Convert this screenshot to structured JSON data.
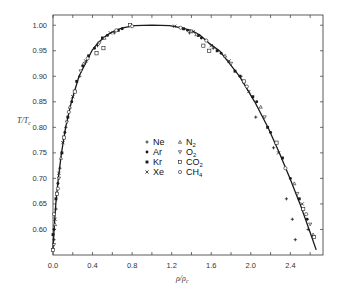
{
  "chart_data": {
    "type": "scatter",
    "title": "",
    "xlabel": "ρ/ρc",
    "ylabel": "T/Tc",
    "xlim": [
      0.0,
      2.73
    ],
    "ylim": [
      0.55,
      1.02
    ],
    "x_ticks": [
      0.0,
      0.2,
      0.4,
      0.6,
      0.8,
      1.0,
      1.2,
      1.4,
      1.6,
      1.8,
      2.0,
      2.2,
      2.4,
      2.6
    ],
    "x_tick_labels": [
      "0.0",
      "0.4",
      "0.8",
      "1.2",
      "1.6",
      "2.0",
      "2.4"
    ],
    "x_labeled_values": [
      0.0,
      0.4,
      0.8,
      1.2,
      1.6,
      2.0,
      2.4
    ],
    "y_ticks": [
      1.0,
      0.95,
      0.9,
      0.85,
      0.8,
      0.75,
      0.7,
      0.65,
      0.6
    ],
    "y_tick_labels": [
      "1.00",
      "0.95",
      "0.90",
      "0.85",
      "0.80",
      "0.75",
      "0.70",
      "0.65",
      "0.60"
    ],
    "grid": false,
    "legend_position": "center",
    "legend": [
      {
        "name": "Ne",
        "marker": "plus"
      },
      {
        "name": "Ar",
        "marker": "filled-circle"
      },
      {
        "name": "Kr",
        "marker": "filled-square"
      },
      {
        "name": "Xe",
        "marker": "cross"
      },
      {
        "name": "N2",
        "marker": "triangle-up"
      },
      {
        "name": "O2",
        "marker": "triangle-down"
      },
      {
        "name": "CO2",
        "marker": "open-square"
      },
      {
        "name": "CH4",
        "marker": "open-circle"
      }
    ],
    "curve": {
      "name": "fitted coexistence curve",
      "points": [
        [
          -0.001,
          0.56
        ],
        [
          0.011,
          0.6
        ],
        [
          0.028,
          0.65
        ],
        [
          0.054,
          0.7
        ],
        [
          0.086,
          0.75
        ],
        [
          0.127,
          0.8
        ],
        [
          0.186,
          0.85
        ],
        [
          0.263,
          0.9
        ],
        [
          0.393,
          0.95
        ],
        [
          0.452,
          0.965
        ],
        [
          0.54,
          0.98
        ],
        [
          0.632,
          0.99
        ],
        [
          0.705,
          0.995
        ],
        [
          0.827,
          0.999
        ],
        [
          1.0,
          1.0
        ],
        [
          1.18,
          0.999
        ],
        [
          1.303,
          0.995
        ],
        [
          1.395,
          0.99
        ],
        [
          1.49,
          0.98
        ],
        [
          1.576,
          0.965
        ],
        [
          1.682,
          0.95
        ],
        [
          1.887,
          0.9
        ],
        [
          2.039,
          0.85
        ],
        [
          2.173,
          0.8
        ],
        [
          2.289,
          0.75
        ],
        [
          2.396,
          0.7
        ],
        [
          2.497,
          0.65
        ],
        [
          2.589,
          0.6
        ],
        [
          2.661,
          0.56
        ]
      ]
    },
    "series": [
      {
        "name": "Ne",
        "marker": "plus",
        "points": [
          [
            0.01,
            0.58
          ],
          [
            0.03,
            0.64
          ],
          [
            0.07,
            0.72
          ],
          [
            0.13,
            0.8
          ],
          [
            0.27,
            0.9
          ],
          [
            0.45,
            0.96
          ],
          [
            0.62,
            0.985
          ],
          [
            1.38,
            0.985
          ],
          [
            1.62,
            0.955
          ],
          [
            1.9,
            0.9
          ],
          [
            2.05,
            0.82
          ],
          [
            2.23,
            0.76
          ],
          [
            2.36,
            0.66
          ],
          [
            2.42,
            0.62
          ],
          [
            2.45,
            0.58
          ],
          [
            2.58,
            0.6
          ]
        ]
      },
      {
        "name": "Ar",
        "marker": "filled-circle",
        "points": [
          [
            0.01,
            0.6
          ],
          [
            0.05,
            0.69
          ],
          [
            0.12,
            0.79
          ],
          [
            0.19,
            0.85
          ],
          [
            0.3,
            0.92
          ],
          [
            0.42,
            0.955
          ],
          [
            0.55,
            0.98
          ],
          [
            0.7,
            0.993
          ],
          [
            1.36,
            0.99
          ],
          [
            1.5,
            0.975
          ],
          [
            1.7,
            0.945
          ],
          [
            1.89,
            0.9
          ],
          [
            2.06,
            0.85
          ],
          [
            2.2,
            0.79
          ],
          [
            2.4,
            0.7
          ],
          [
            2.57,
            0.62
          ]
        ]
      },
      {
        "name": "Kr",
        "marker": "filled-square",
        "points": [
          [
            0.0,
            0.59
          ],
          [
            0.03,
            0.66
          ],
          [
            0.09,
            0.75
          ],
          [
            0.15,
            0.82
          ],
          [
            0.24,
            0.89
          ],
          [
            0.36,
            0.94
          ],
          [
            0.5,
            0.975
          ],
          [
            0.66,
            0.99
          ],
          [
            1.32,
            0.993
          ],
          [
            1.47,
            0.98
          ],
          [
            1.66,
            0.95
          ],
          [
            1.84,
            0.91
          ],
          [
            2.02,
            0.86
          ],
          [
            2.17,
            0.8
          ],
          [
            2.32,
            0.74
          ],
          [
            2.49,
            0.66
          ]
        ]
      },
      {
        "name": "Xe",
        "marker": "cross",
        "points": [
          [
            0.02,
            0.62
          ],
          [
            0.06,
            0.71
          ],
          [
            0.1,
            0.77
          ],
          [
            0.2,
            0.86
          ],
          [
            0.33,
            0.93
          ],
          [
            0.58,
            0.985
          ],
          [
            1.23,
            0.998
          ],
          [
            1.42,
            0.987
          ],
          [
            1.6,
            0.96
          ],
          [
            1.78,
            0.93
          ],
          [
            1.98,
            0.87
          ],
          [
            2.28,
            0.75
          ],
          [
            2.52,
            0.65
          ]
        ]
      },
      {
        "name": "N2",
        "marker": "triangle-up",
        "points": [
          [
            0.02,
            0.61
          ],
          [
            0.08,
            0.74
          ],
          [
            0.17,
            0.84
          ],
          [
            0.31,
            0.925
          ],
          [
            0.52,
            0.975
          ],
          [
            1.45,
            0.982
          ],
          [
            1.74,
            0.94
          ],
          [
            2.1,
            0.84
          ],
          [
            2.44,
            0.69
          ],
          [
            2.63,
            0.59
          ]
        ]
      },
      {
        "name": "O2",
        "marker": "triangle-down",
        "points": [
          [
            0.01,
            0.57
          ],
          [
            0.06,
            0.7
          ],
          [
            0.14,
            0.81
          ],
          [
            0.28,
            0.91
          ],
          [
            0.47,
            0.965
          ],
          [
            1.4,
            0.988
          ],
          [
            1.8,
            0.925
          ],
          [
            2.14,
            0.82
          ],
          [
            2.47,
            0.67
          ],
          [
            2.6,
            0.61
          ]
        ]
      },
      {
        "name": "CO2",
        "marker": "open-square",
        "points": [
          [
            0.0,
            0.56
          ],
          [
            0.04,
            0.67
          ],
          [
            0.11,
            0.78
          ],
          [
            0.22,
            0.87
          ],
          [
            0.44,
            0.945
          ],
          [
            0.51,
            0.955
          ],
          [
            0.78,
            1.0
          ],
          [
            1.52,
            0.96
          ],
          [
            1.58,
            0.95
          ],
          [
            1.93,
            0.89
          ],
          [
            2.26,
            0.77
          ],
          [
            2.53,
            0.64
          ],
          [
            2.64,
            0.585
          ]
        ]
      },
      {
        "name": "CH4",
        "marker": "open-circle",
        "points": [
          [
            0.01,
            0.63
          ],
          [
            0.05,
            0.68
          ],
          [
            0.16,
            0.83
          ],
          [
            0.35,
            0.935
          ],
          [
            0.64,
            0.99
          ],
          [
            0.8,
            0.998
          ],
          [
            1.29,
            0.995
          ],
          [
            1.55,
            0.97
          ],
          [
            1.96,
            0.88
          ],
          [
            2.35,
            0.72
          ],
          [
            2.56,
            0.63
          ]
        ]
      }
    ]
  },
  "legend_labels": {
    "col1": [
      "Ne",
      "Ar",
      "Kr",
      "Xe"
    ],
    "col2": [
      {
        "base": "N",
        "sub": "2"
      },
      {
        "base": "O",
        "sub": "2"
      },
      {
        "base": "CO",
        "sub": "2"
      },
      {
        "base": "CH",
        "sub": "4"
      }
    ]
  },
  "axes": {
    "ylabel_main": "T/T",
    "ylabel_sub": "c",
    "xlabel_main": "ρ/ρ",
    "xlabel_sub": "c"
  },
  "colors": {
    "ink": "#1a1a1a",
    "frame": "#333333",
    "background": "#ffffff"
  }
}
